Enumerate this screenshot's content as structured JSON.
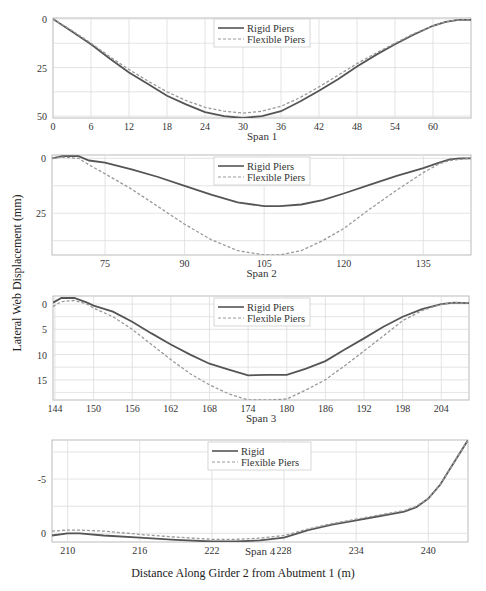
{
  "figure": {
    "ylabel": "Lateral Web Displacement (mm)",
    "xlabel": "Distance Along Girder 2 from Abutment 1 (m)"
  },
  "chart_data": [
    {
      "type": "line",
      "title": "",
      "xlabel": "Span 1",
      "ylabel": "Lateral Web Displacement (mm)",
      "xlim": [
        0,
        66
      ],
      "ylim": [
        51,
        -0.5
      ],
      "y_inverted": true,
      "xticks": [
        0,
        6,
        12,
        18,
        24,
        30,
        36,
        42,
        48,
        54,
        60
      ],
      "yticks": [
        0,
        25,
        50
      ],
      "grid": true,
      "legend_position": "upper center",
      "series": [
        {
          "name": "Rigid Piers",
          "style": "solid",
          "x": [
            0,
            3,
            6,
            9,
            12,
            15,
            18,
            21,
            24,
            27,
            30,
            33,
            36,
            39,
            42,
            45,
            48,
            51,
            54,
            57,
            60,
            62,
            64,
            66
          ],
          "y": [
            0,
            6.5,
            13,
            20.5,
            27.5,
            33.5,
            39.5,
            44,
            48,
            50,
            51,
            50,
            47.5,
            42.5,
            37,
            31,
            24.5,
            18.5,
            13,
            8,
            3.5,
            1.5,
            0.5,
            0.5
          ]
        },
        {
          "name": "Flexible Piers",
          "style": "dashed",
          "x": [
            0,
            3,
            6,
            9,
            12,
            15,
            18,
            21,
            24,
            27,
            30,
            33,
            36,
            39,
            42,
            45,
            48,
            51,
            54,
            57,
            60,
            62,
            64,
            66
          ],
          "y": [
            0,
            6,
            12.5,
            19.5,
            26,
            32,
            37.5,
            42,
            45.5,
            47.5,
            48.5,
            47.5,
            45,
            40.5,
            35,
            29,
            23,
            17.5,
            12.5,
            7.5,
            3.5,
            1.5,
            0.5,
            0.5
          ]
        }
      ]
    },
    {
      "type": "line",
      "title": "",
      "xlabel": "Span 2",
      "ylabel": "Lateral Web Displacement (mm)",
      "xlim": [
        65,
        144
      ],
      "ylim": [
        44,
        -1.5
      ],
      "y_inverted": true,
      "xticks": [
        75,
        90,
        105,
        120,
        135
      ],
      "yticks": [
        0,
        25
      ],
      "grid": true,
      "legend_position": "upper center",
      "series": [
        {
          "name": "Rigid Piers",
          "style": "solid",
          "x": [
            65,
            67,
            70,
            72,
            75,
            80,
            85,
            90,
            95,
            100,
            105,
            108,
            112,
            116,
            120,
            125,
            130,
            135,
            138,
            140,
            142,
            144
          ],
          "y": [
            0,
            -1,
            -1,
            1,
            2,
            5,
            8.5,
            12.5,
            16.5,
            20,
            21.8,
            21.8,
            21,
            19,
            16,
            12,
            8,
            4.5,
            2,
            0.5,
            0,
            0
          ]
        },
        {
          "name": "Flexible Piers",
          "style": "dashed",
          "x": [
            65,
            67,
            70,
            72,
            75,
            80,
            85,
            90,
            95,
            100,
            105,
            108,
            112,
            116,
            120,
            125,
            130,
            135,
            138,
            140,
            142,
            144
          ],
          "y": [
            0,
            -0.5,
            0,
            3,
            7,
            14,
            22,
            30,
            37,
            42,
            44,
            44,
            42,
            37.5,
            32,
            23,
            14.5,
            6.5,
            2.5,
            1,
            0.5,
            0
          ]
        }
      ]
    },
    {
      "type": "line",
      "title": "",
      "xlabel": "Span 3",
      "ylabel": "Lateral Web Displacement (mm)",
      "xlim": [
        143.7,
        208.3
      ],
      "ylim": [
        19,
        -1.6
      ],
      "y_inverted": true,
      "xticks": [
        144,
        150,
        156,
        162,
        168,
        174,
        180,
        186,
        192,
        198,
        204
      ],
      "yticks": [
        0,
        5,
        10,
        15
      ],
      "grid": true,
      "legend_position": "upper center",
      "series": [
        {
          "name": "Rigid Piers",
          "style": "solid",
          "x": [
            143.7,
            145,
            147,
            149,
            150,
            153,
            156,
            159,
            162,
            165,
            168,
            171,
            174,
            177,
            180,
            183,
            186,
            189,
            192,
            195,
            198,
            201,
            204,
            206,
            208.3
          ],
          "y": [
            -0.3,
            -1.2,
            -1.2,
            -0.3,
            0.3,
            1.5,
            3.5,
            5.8,
            8,
            10,
            11.8,
            13,
            14.1,
            14,
            14,
            12.8,
            11.3,
            9,
            6.8,
            4.5,
            2.5,
            1,
            0,
            -0.3,
            -0.2
          ]
        },
        {
          "name": "Flexible Piers",
          "style": "dashed",
          "x": [
            143.7,
            145,
            147,
            149,
            150,
            153,
            156,
            159,
            162,
            165,
            168,
            171,
            174,
            177,
            180,
            183,
            186,
            189,
            192,
            195,
            198,
            201,
            204,
            206,
            208.3
          ],
          "y": [
            0.5,
            -0.5,
            -0.7,
            0,
            0.8,
            2.5,
            5,
            8,
            11,
            13.8,
            16,
            17.8,
            19,
            19,
            18.8,
            17,
            15,
            12.2,
            9.3,
            6.3,
            3.3,
            1.3,
            0,
            -0.3,
            -0.2
          ]
        }
      ]
    },
    {
      "type": "line",
      "title": "",
      "xlabel": "Span 4",
      "ylabel": "Lateral Web Displacement (mm)",
      "xlim": [
        208.7,
        243.3
      ],
      "ylim": [
        0.8,
        -8.6
      ],
      "y_inverted": true,
      "xticks": [
        210,
        216,
        222,
        228,
        234,
        240
      ],
      "yticks": [
        -5,
        0
      ],
      "grid": true,
      "legend_position": "upper center",
      "series": [
        {
          "name": "Rigid",
          "style": "solid",
          "x": [
            208.7,
            210,
            211,
            213,
            216,
            219,
            222,
            224,
            226,
            228,
            230,
            232,
            234,
            236,
            238,
            239,
            240,
            241,
            242,
            243.3
          ],
          "y": [
            0.2,
            0,
            0,
            0.2,
            0.4,
            0.6,
            0.75,
            0.75,
            0.65,
            0.4,
            -0.3,
            -0.8,
            -1.2,
            -1.6,
            -2,
            -2.4,
            -3.2,
            -4.5,
            -6.3,
            -8.6
          ]
        },
        {
          "name": "Flexible Piers",
          "style": "dashed",
          "x": [
            208.7,
            210,
            211,
            213,
            216,
            219,
            222,
            224,
            226,
            228,
            230,
            232,
            234,
            236,
            238,
            239,
            240,
            241,
            242,
            243.3
          ],
          "y": [
            -0.2,
            -0.3,
            -0.3,
            -0.2,
            0.1,
            0.35,
            0.55,
            0.55,
            0.45,
            0.2,
            -0.4,
            -0.9,
            -1.3,
            -1.7,
            -2.1,
            -2.5,
            -3.2,
            -4.5,
            -6.3,
            -8.6
          ]
        }
      ]
    }
  ]
}
